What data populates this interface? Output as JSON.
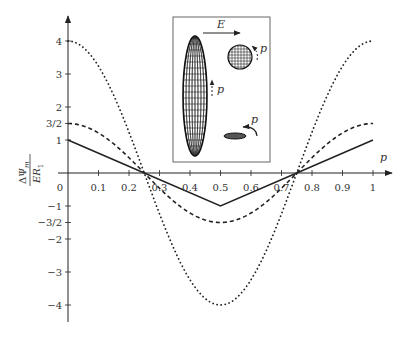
{
  "chart_data": {
    "type": "line",
    "title": "",
    "xlabel": "p",
    "ylabel_numerator": "ΔΨ",
    "ylabel_subscript": "m",
    "ylabel_denominator": "ER",
    "ylabel_denominator_subscript": "1",
    "xlim": [
      0,
      1
    ],
    "ylim": [
      -4.5,
      4.8
    ],
    "grid": false,
    "legend": "none",
    "x_ticks": [
      0.1,
      0.2,
      0.3,
      0.4,
      0.5,
      0.6,
      0.7,
      0.8,
      0.9,
      1
    ],
    "x_tick_labels": [
      "0",
      "0.1",
      "0.2",
      "0.3",
      "0.4",
      "0.5",
      "0.6",
      "0.7",
      "0.8",
      "0.9",
      "1"
    ],
    "y_ticks": [
      4,
      3,
      2,
      1.5,
      1,
      -1,
      -1.5,
      -2,
      -3,
      -4
    ],
    "y_tick_labels": [
      "4",
      "3",
      "2",
      "3/2",
      "1",
      "−1",
      "−3/2",
      "−2",
      "−3",
      "−4"
    ],
    "series": [
      {
        "name": "dotted",
        "style": "dotted",
        "formula": "4cos(2πp)",
        "x": [
          0,
          0.1,
          0.2,
          0.25,
          0.3,
          0.4,
          0.5,
          0.6,
          0.7,
          0.75,
          0.8,
          0.9,
          1
        ],
        "values": [
          4,
          3.24,
          1.24,
          0,
          -1.24,
          -3.24,
          -4,
          -3.24,
          -1.24,
          0,
          1.24,
          3.24,
          4
        ]
      },
      {
        "name": "dashed",
        "style": "dashed",
        "formula": "1.5cos(2πp)",
        "x": [
          0,
          0.1,
          0.2,
          0.25,
          0.3,
          0.4,
          0.5,
          0.6,
          0.7,
          0.75,
          0.8,
          0.9,
          1
        ],
        "values": [
          1.5,
          1.21,
          0.46,
          0,
          -0.46,
          -1.21,
          -1.5,
          -1.21,
          -0.46,
          0,
          0.46,
          1.21,
          1.5
        ]
      },
      {
        "name": "solid",
        "style": "solid",
        "formula": "triangle wave",
        "x": [
          0,
          0.25,
          0.5,
          0.75,
          1
        ],
        "values": [
          1,
          0,
          -1,
          0,
          1
        ]
      }
    ],
    "inset": {
      "field_label": "E",
      "p_label_ellipsoid": "p",
      "p_label_sphere": "p",
      "p_label_disk": "p",
      "shapes": [
        "prolate-ellipsoid",
        "sphere",
        "oblate-disk"
      ]
    }
  }
}
